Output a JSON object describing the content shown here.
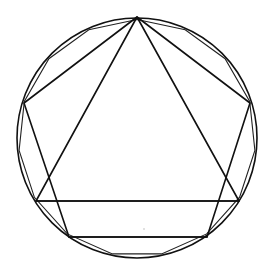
{
  "diagram": {
    "title": "",
    "description_shapes": [
      "circle",
      "inscribed-pentagon",
      "inscribed-triangle",
      "inscribed-15-gon"
    ],
    "colors": {
      "stroke": "#111111",
      "background": "#ffffff"
    },
    "circle": {
      "cx": 137,
      "cy": 138,
      "r": 120
    },
    "pentagon": {
      "vertices": [
        [
          137,
          17
        ],
        [
          250,
          103
        ],
        [
          207,
          237
        ],
        [
          69,
          237
        ],
        [
          24,
          103
        ]
      ]
    },
    "triangle": {
      "vertices": [
        [
          137,
          17
        ],
        [
          239,
          201
        ],
        [
          36,
          201
        ]
      ]
    },
    "chords": [
      {
        "from": [
          36,
          201
        ],
        "to": [
          239,
          201
        ]
      },
      {
        "from": [
          69,
          237
        ],
        "to": [
          207,
          237
        ]
      }
    ],
    "polygon15": {
      "sides": 15,
      "start_angle_deg": -90
    }
  }
}
